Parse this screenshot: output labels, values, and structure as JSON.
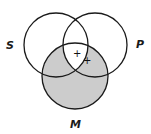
{
  "diagram": {
    "type": "venn-3-circle",
    "circles": [
      {
        "id": "S",
        "label": "S",
        "cx": 56,
        "cy": 45,
        "r": 32
      },
      {
        "id": "P",
        "label": "P",
        "cx": 95,
        "cy": 45,
        "r": 32
      },
      {
        "id": "M",
        "label": "M",
        "cx": 75,
        "cy": 76,
        "r": 33
      }
    ],
    "shaded_regions": [
      "M only",
      "S∩M without P",
      "P∩M without S"
    ],
    "unshaded_regions": [
      "S∩P∩M"
    ],
    "shade_color": "#cccccc",
    "stroke_color": "#1a1a1a",
    "marks": [
      {
        "symbol": "+",
        "x": 76,
        "y": 56,
        "region": "S∩P∩M"
      },
      {
        "symbol": "+",
        "x": 86,
        "y": 63,
        "region": "boundary of S in P∩M"
      }
    ]
  }
}
